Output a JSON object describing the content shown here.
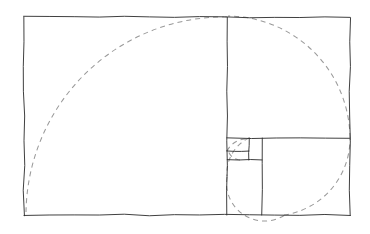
{
  "figure": {
    "canvas": {
      "width": 370,
      "height": 234
    },
    "background_color": "#ffffff"
  },
  "style": {
    "frame_color": "#2a2a2a",
    "frame_width": 0.9,
    "spiral_color": "#9a9a9a",
    "spiral_width": 1.05,
    "spiral_dash": "5 4"
  },
  "geometry": {
    "outer_rect": {
      "name": "golden-rectangle",
      "x": 24,
      "y": 17,
      "width": 326,
      "height": 198,
      "ratio_label": "1.618"
    },
    "divisions": [
      {
        "name": "square-1-major-vertical-divider",
        "orientation": "vertical",
        "x": 227,
        "y1": 17,
        "y2": 215
      },
      {
        "name": "square-2-horizontal-divider",
        "orientation": "horizontal",
        "y": 138,
        "x1": 227,
        "x2": 350
      },
      {
        "name": "square-3-vertical-divider",
        "orientation": "vertical",
        "x": 262,
        "y1": 138,
        "y2": 215
      },
      {
        "name": "square-4-horizontal-divider",
        "orientation": "horizontal",
        "y": 160,
        "x1": 227,
        "x2": 262
      },
      {
        "name": "square-5-vertical-divider",
        "orientation": "vertical",
        "x": 249,
        "y1": 138,
        "y2": 160
      },
      {
        "name": "square-6-horizontal-divider",
        "orientation": "horizontal",
        "y": 151,
        "x1": 227,
        "x2": 249
      }
    ],
    "squares": [
      {
        "name": "square-largest",
        "x": 24,
        "y": 17,
        "size": 198,
        "index": 1
      },
      {
        "name": "square-second",
        "x": 227,
        "y": 138,
        "size": 123,
        "index": 2
      },
      {
        "name": "square-third",
        "x": 227,
        "y": 138,
        "size": 77,
        "index": 3
      },
      {
        "name": "square-fourth",
        "x": 227,
        "y": 138,
        "size": 35,
        "index": 4
      },
      {
        "name": "square-fifth",
        "x": 227,
        "y": 138,
        "size": 22,
        "index": 5
      },
      {
        "name": "square-sixth",
        "x": 227,
        "y": 138,
        "size": 13,
        "index": 6
      }
    ],
    "spiral_segments": [
      {
        "name": "spiral-arc-largest",
        "path": "M 227 17 A 198 198 0 0 0 26 213",
        "square_index": 1
      },
      {
        "name": "spiral-arc-second",
        "path": "M 350 138 A 123 123 0 0 0 228 16",
        "square_index": 2
      },
      {
        "name": "spiral-arc-third",
        "path": "M 284 215 A 77 77 0 0 0 350 139",
        "square_index": 3
      },
      {
        "name": "spiral-arc-fourth",
        "path": "M 227 177 A 38 38 0 0 0 285 215",
        "square_index": 4
      },
      {
        "name": "spiral-arc-fifth",
        "path": "M 249 138 A 39 39 0 0 0 227 176",
        "square_index": 5
      },
      {
        "name": "spiral-arc-sixth",
        "path": "M 227 151 A 22 22 0 0 1 249 139",
        "square_index": 6
      },
      {
        "name": "spiral-arc-seventh",
        "path": "M 240 160 A 13 13 0 0 1 228 150",
        "square_index": 7
      }
    ]
  }
}
